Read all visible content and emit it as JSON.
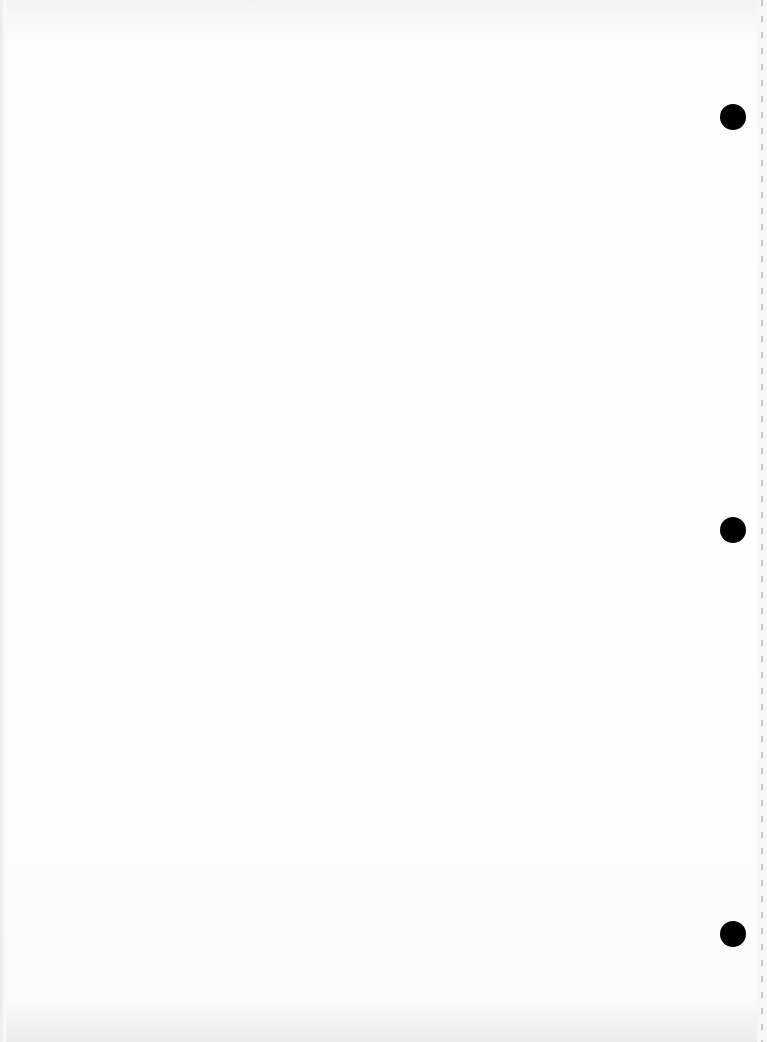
{
  "document": {
    "type": "blank scanned page",
    "text": "",
    "punch_holes": [
      {
        "cx": 733,
        "cy": 117
      },
      {
        "cx": 733,
        "cy": 530
      },
      {
        "cx": 733,
        "cy": 934
      }
    ],
    "colors": {
      "paper": "#fdfdfd",
      "hole": "#000000",
      "edge_dashes": "#b8b8b8"
    }
  }
}
